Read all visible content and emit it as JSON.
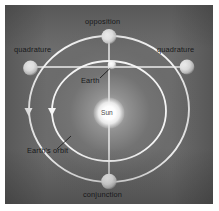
{
  "diagram": {
    "background_color": "#6d6d6d",
    "frame_color": "#ffffff",
    "orbit_stroke_color": "#f2f2f2",
    "label_color": "#17181a",
    "labels": {
      "opposition": "opposition",
      "quadrature_left": "quadrature",
      "quadrature_right": "quadrature",
      "earth": "Earth",
      "sun": "Sun",
      "earths_orbit": "Earth's orbit",
      "conjunction": "conjunction"
    },
    "bodies": [
      {
        "name": "sun",
        "label": "Sun",
        "orbit": "center",
        "position": "center"
      },
      {
        "name": "earth",
        "label": "Earth",
        "orbit": "inner",
        "position": "top"
      },
      {
        "name": "planet-opposition",
        "label": "opposition",
        "orbit": "outer",
        "position": "top"
      },
      {
        "name": "planet-quadrature-left",
        "label": "quadrature",
        "orbit": "outer",
        "position": "left"
      },
      {
        "name": "planet-quadrature-right",
        "label": "quadrature",
        "orbit": "outer",
        "position": "right"
      },
      {
        "name": "planet-conjunction",
        "label": "conjunction",
        "orbit": "outer",
        "position": "bottom"
      }
    ],
    "orbits": [
      {
        "name": "outer-orbit",
        "label": "superior planet orbit",
        "direction": "counterclockwise"
      },
      {
        "name": "inner-orbit",
        "label": "Earth's orbit",
        "direction": "counterclockwise"
      }
    ],
    "sight_lines": [
      {
        "name": "opposition-conjunction-line",
        "from": "opposition",
        "through": "earth,sun",
        "to": "conjunction"
      },
      {
        "name": "quadrature-line",
        "from": "quadrature-left",
        "through": "earth",
        "to": "quadrature-right"
      }
    ],
    "direction_markers": [
      {
        "name": "outer-orbit-arrow",
        "shape": "triangle",
        "points": "down"
      },
      {
        "name": "inner-orbit-arrow",
        "shape": "triangle",
        "points": "down"
      }
    ]
  }
}
